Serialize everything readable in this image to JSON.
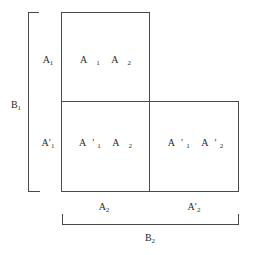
{
  "diagram": {
    "type": "partition-diagram",
    "line_color": "#4a4a4a",
    "cells": [
      {
        "id": "top-left",
        "items": [
          {
            "base": "A",
            "prime": "",
            "sub": "1"
          },
          {
            "base": "A",
            "prime": "",
            "sub": "2"
          }
        ]
      },
      {
        "id": "bottom-left",
        "items": [
          {
            "base": "A",
            "prime": "′",
            "sub": "1"
          },
          {
            "base": "A",
            "prime": "",
            "sub": "2"
          }
        ]
      },
      {
        "id": "bottom-right",
        "items": [
          {
            "base": "A",
            "prime": "′",
            "sub": "1"
          },
          {
            "base": "A",
            "prime": "′",
            "sub": "2"
          }
        ]
      }
    ],
    "row_labels": [
      {
        "base": "A",
        "prime": "",
        "sub": "1"
      },
      {
        "base": "A",
        "prime": "′",
        "sub": "1"
      }
    ],
    "column_labels": [
      {
        "base": "A",
        "prime": "",
        "sub": "2"
      },
      {
        "base": "A",
        "prime": "′",
        "sub": "2"
      }
    ],
    "left_bracket_label": {
      "base": "B",
      "prime": "",
      "sub": "1"
    },
    "bottom_bracket_label": {
      "base": "B",
      "prime": "",
      "sub": "2"
    }
  }
}
